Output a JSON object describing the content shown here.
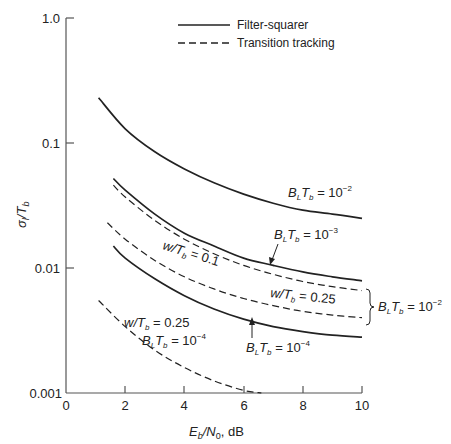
{
  "chart_data": {
    "type": "line",
    "title": "",
    "xlabel": "E_b/N_0, dB",
    "ylabel": "σ_l/T_b",
    "xlim": [
      0,
      10
    ],
    "ylim": [
      0.001,
      1.0
    ],
    "yscale": "log",
    "grid": false,
    "legend_position": "top-center",
    "x_ticks": [
      "0",
      "2",
      "4",
      "6",
      "8",
      "10"
    ],
    "y_ticks": [
      "0.001",
      "0.01",
      "0.1",
      "1.0"
    ],
    "legend": [
      {
        "label": "Filter-squarer",
        "style": "solid"
      },
      {
        "label": "Transition tracking",
        "style": "dashed"
      }
    ],
    "series": [
      {
        "name": "Filter-squarer, B_L T_b = 10^-2",
        "style": "solid",
        "x": [
          1.1,
          2,
          3,
          4,
          5,
          6,
          7,
          8,
          9,
          10
        ],
        "values": [
          0.23,
          0.13,
          0.085,
          0.062,
          0.048,
          0.039,
          0.033,
          0.029,
          0.027,
          0.025
        ]
      },
      {
        "name": "Filter-squarer, B_L T_b = 10^-3",
        "style": "solid",
        "x": [
          1.6,
          2,
          3,
          4,
          5,
          6,
          7,
          8,
          9,
          10
        ],
        "values": [
          0.052,
          0.042,
          0.027,
          0.019,
          0.015,
          0.012,
          0.0105,
          0.0093,
          0.0085,
          0.0079
        ]
      },
      {
        "name": "Transition tracking, w/T_b = 0.1, B_L T_b = 10^-2",
        "style": "dashed",
        "x": [
          1.6,
          2,
          3,
          4,
          5,
          6,
          7,
          8,
          9,
          10
        ],
        "values": [
          0.046,
          0.037,
          0.024,
          0.017,
          0.013,
          0.0105,
          0.0089,
          0.0078,
          0.0071,
          0.0066
        ]
      },
      {
        "name": "Transition tracking, w/T_b = 0.25, B_L T_b = 10^-2",
        "style": "dashed",
        "x": [
          1.4,
          2,
          3,
          4,
          5,
          6,
          7,
          8,
          9,
          10
        ],
        "values": [
          0.023,
          0.017,
          0.0115,
          0.0085,
          0.0068,
          0.0057,
          0.005,
          0.0045,
          0.0042,
          0.004
        ]
      },
      {
        "name": "Filter-squarer, B_L T_b = 10^-4",
        "style": "solid",
        "x": [
          1.6,
          2,
          3,
          4,
          5,
          6,
          7,
          8,
          9,
          10
        ],
        "values": [
          0.015,
          0.012,
          0.0082,
          0.006,
          0.0047,
          0.0039,
          0.0034,
          0.0031,
          0.0029,
          0.0028
        ]
      },
      {
        "name": "Transition tracking, w/T_b = 0.25, B_L T_b = 10^-4",
        "style": "dashed",
        "x": [
          1.1,
          2,
          3,
          4,
          5,
          6,
          6.6
        ],
        "values": [
          0.0055,
          0.0034,
          0.0022,
          0.0016,
          0.00125,
          0.00105,
          0.001
        ]
      }
    ],
    "annotations": [
      {
        "text": "B_L T_b = 10^-2",
        "target": "top solid curve"
      },
      {
        "text": "B_L T_b = 10^-3",
        "target": "second solid curve",
        "arrow": true
      },
      {
        "text": "w/T_b = 0.1",
        "target": "upper dashed curve"
      },
      {
        "text": "w/T_b = 0.25",
        "target": "lower dashed curve"
      },
      {
        "text": "B_L T_b = 10^-2",
        "target": "brace grouping both dashed curves"
      },
      {
        "text": "B_L T_b = 10^-4",
        "target": "lower solid curve",
        "arrow": true
      },
      {
        "text": "w/T_b = 0.25, B_L T_b = 10^-4",
        "target": "bottom dashed curve"
      }
    ]
  },
  "labels": {
    "legend_solid": "Filter-squarer",
    "legend_dashed": "Transition tracking",
    "xlabel_main": "E",
    "xlabel_sub": "b",
    "xlabel_rest": "/N",
    "xlabel_sub2": "0",
    "xlabel_unit": ", dB",
    "ylabel_main": "σ",
    "ylabel_sub": "l",
    "ylabel_rest": "/T",
    "ylabel_sub2": "b",
    "y_ticks": [
      "1.0",
      "0.1",
      "0.01",
      "0.001"
    ],
    "x_ticks": [
      "0",
      "2",
      "4",
      "6",
      "8",
      "10"
    ],
    "ann_blt": "B",
    "ann_l": "L",
    "ann_t": "T",
    "ann_b": "b",
    "ann_eq": " = 10",
    "exp_m2": "−2",
    "exp_m3": "−3",
    "exp_m4": "−4",
    "ann_w": "w/T",
    "ann_w01": " = 0.1",
    "ann_w025": " = 0.25"
  }
}
